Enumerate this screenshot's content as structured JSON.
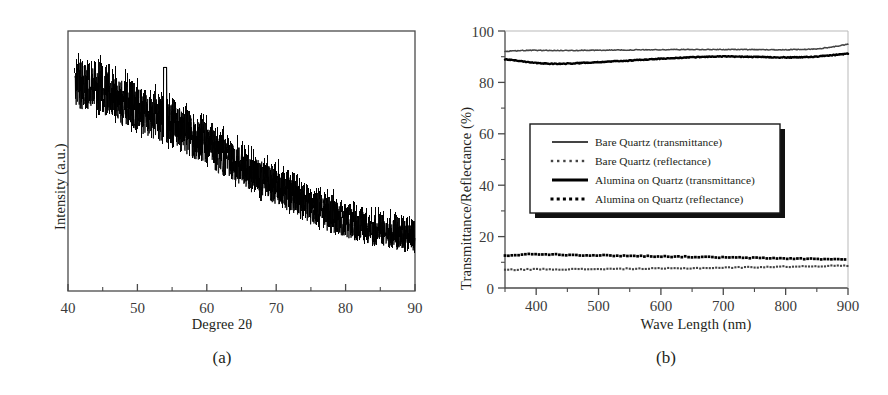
{
  "figure": {
    "panels": [
      {
        "caption": "(a)",
        "chart": {
          "type": "line",
          "title": "",
          "xlabel": "Degree 2θ",
          "ylabel": "Intensity (a.u.)",
          "xlim": [
            40,
            90
          ],
          "ylim": [
            0,
            1
          ],
          "xticks": [
            40,
            50,
            60,
            70,
            80,
            90
          ],
          "xticklabels": [
            "40",
            "50",
            "60",
            "70",
            "80",
            "90"
          ],
          "minor_xticks": [
            45,
            55,
            65,
            75,
            85
          ],
          "yticks": [],
          "yticklabels": [],
          "grid": false,
          "frame": "box",
          "legend": null,
          "series": [
            {
              "name": "XRD pattern (amorphous alumina on quartz)",
              "color": "#000000",
              "style": "noisy-line",
              "description": "Broad amorphous halo with high-frequency counting noise; intensity decays monotonically from 2θ=41° to 2θ=90° with a small sharp spike near 2θ=54°",
              "envelope_x": [
                41,
                44,
                47,
                50,
                52,
                54,
                57,
                60,
                63,
                66,
                69,
                72,
                75,
                78,
                81,
                84,
                87,
                90
              ],
              "envelope_y": [
                0.8,
                0.78,
                0.74,
                0.7,
                0.67,
                0.66,
                0.61,
                0.56,
                0.51,
                0.46,
                0.42,
                0.37,
                0.32,
                0.29,
                0.26,
                0.24,
                0.22,
                0.21
              ],
              "noise_amplitude": 0.1,
              "spike_x": 54,
              "spike_y": 0.86
            }
          ]
        }
      },
      {
        "caption": "(b)",
        "chart": {
          "type": "line",
          "title": "",
          "xlabel": "Wave Length (nm)",
          "ylabel": "Transmittance/Reflectance (%)",
          "xlim": [
            350,
            900
          ],
          "ylim": [
            0,
            100
          ],
          "xticks": [
            400,
            500,
            600,
            700,
            800,
            900
          ],
          "xticklabels": [
            "400",
            "500",
            "600",
            "700",
            "800",
            "900"
          ],
          "yticks": [
            0,
            20,
            40,
            60,
            80,
            100
          ],
          "yticklabels": [
            "0",
            "20",
            "40",
            "60",
            "80",
            "100"
          ],
          "minor_yticks": [
            10,
            30,
            50,
            70,
            90
          ],
          "grid": false,
          "frame": "left-bottom",
          "legend": {
            "position": "center-left",
            "entries": [
              {
                "label": "Bare Quartz (transmittance)",
                "style": "solid-thin",
                "color": "#444444"
              },
              {
                "label": "Bare Quartz (reflectance)",
                "style": "dotted-thin",
                "color": "#444444"
              },
              {
                "label": "Alumina on Quartz (transmittance)",
                "style": "solid-thick",
                "color": "#000000"
              },
              {
                "label": "Alumina on Quartz (reflectance)",
                "style": "dotted-thick",
                "color": "#000000"
              }
            ]
          },
          "x": [
            350,
            375,
            400,
            425,
            450,
            475,
            500,
            525,
            550,
            575,
            600,
            625,
            650,
            675,
            700,
            725,
            750,
            775,
            800,
            825,
            850,
            875,
            900
          ],
          "series": [
            {
              "name": "Bare Quartz (transmittance)",
              "style": "solid-thin",
              "color": "#444444",
              "values": [
                92.0,
                92.4,
                92.5,
                92.4,
                92.4,
                92.5,
                92.5,
                92.6,
                92.6,
                92.7,
                92.7,
                92.8,
                92.8,
                92.8,
                92.8,
                92.8,
                92.8,
                92.7,
                92.7,
                92.8,
                93.0,
                93.8,
                94.8
              ]
            },
            {
              "name": "Alumina on Quartz (transmittance)",
              "style": "solid-thick",
              "color": "#000000",
              "values": [
                89.0,
                88.3,
                87.6,
                87.2,
                87.3,
                87.6,
                87.9,
                88.2,
                88.5,
                88.9,
                89.2,
                89.5,
                89.8,
                90.0,
                90.1,
                90.0,
                89.9,
                89.8,
                89.7,
                89.8,
                90.0,
                90.6,
                91.2
              ]
            },
            {
              "name": "Alumina on Quartz (reflectance)",
              "style": "dotted-thick",
              "color": "#000000",
              "values": [
                12.6,
                13.0,
                13.2,
                13.1,
                12.9,
                12.8,
                12.7,
                12.6,
                12.5,
                12.4,
                12.3,
                12.2,
                12.1,
                12.0,
                11.9,
                11.8,
                11.7,
                11.6,
                11.5,
                11.4,
                11.3,
                11.2,
                11.1
              ]
            },
            {
              "name": "Bare Quartz (reflectance)",
              "style": "dotted-thin",
              "color": "#444444",
              "values": [
                7.0,
                7.2,
                7.3,
                7.3,
                7.3,
                7.3,
                7.4,
                7.4,
                7.5,
                7.5,
                7.6,
                7.6,
                7.7,
                7.8,
                7.9,
                8.0,
                8.1,
                8.2,
                8.3,
                8.4,
                8.5,
                8.6,
                8.7
              ]
            }
          ]
        }
      }
    ]
  }
}
